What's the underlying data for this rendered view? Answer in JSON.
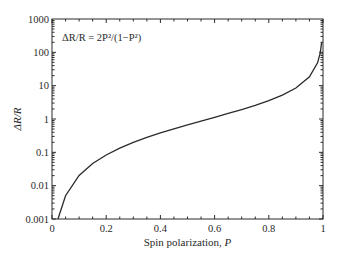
{
  "chart_data": {
    "type": "line",
    "title": "",
    "xlabel": "Spin polarization, P",
    "xlabel_text": "Spin polarization, ",
    "xlabel_var": "P",
    "ylabel": "ΔR/R",
    "annotation": "ΔR/R = 2P²/(1−P²)",
    "xlim": [
      0,
      1
    ],
    "ylim": [
      0.001,
      1000
    ],
    "yscale": "log",
    "grid": false,
    "legend": null,
    "x_ticks": [
      0,
      0.2,
      0.4,
      0.6,
      0.8,
      1
    ],
    "x_tick_labels": [
      "0",
      "0.2",
      "0.4",
      "0.6",
      "0.8",
      "1"
    ],
    "y_ticks": [
      0.001,
      0.01,
      0.1,
      1,
      10,
      100,
      1000
    ],
    "y_tick_labels": [
      "0.001",
      "0.01",
      "0.1",
      "1",
      "10",
      "100",
      "1000"
    ],
    "series": [
      {
        "name": "ΔR/R = 2P²/(1−P²)",
        "color": "#2a2a2a",
        "x": [
          0.022,
          0.05,
          0.1,
          0.15,
          0.2,
          0.25,
          0.3,
          0.35,
          0.4,
          0.45,
          0.5,
          0.55,
          0.6,
          0.65,
          0.7,
          0.75,
          0.8,
          0.85,
          0.9,
          0.95,
          0.98,
          0.99,
          0.995
        ],
        "y": [
          0.00097,
          0.005,
          0.0202,
          0.046,
          0.0833,
          0.1333,
          0.1978,
          0.2791,
          0.381,
          0.5081,
          0.6667,
          0.8674,
          1.125,
          1.463,
          1.922,
          2.571,
          3.556,
          5.22,
          8.526,
          18.51,
          48.51,
          98.5,
          198.5
        ]
      }
    ]
  }
}
